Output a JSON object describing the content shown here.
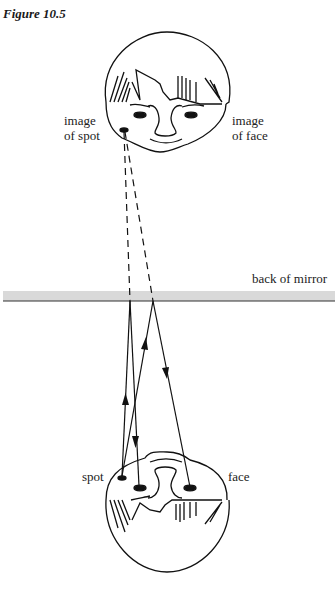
{
  "figure": {
    "title": "Figure 10.5",
    "labels": {
      "image_of_spot": [
        "image",
        "of spot"
      ],
      "image_of_face": [
        "image",
        "of face"
      ],
      "mirror": "back of mirror",
      "spot": "spot",
      "face": "face"
    }
  },
  "colors": {
    "mirror_band": "#d9d9d9",
    "mirror_line": "#333333",
    "ink": "#111111"
  }
}
